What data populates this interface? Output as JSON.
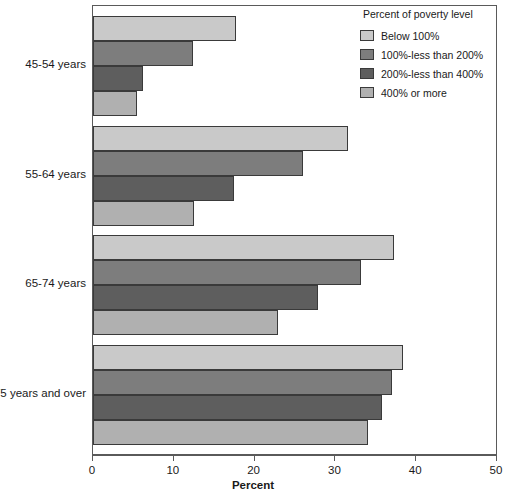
{
  "chart_data": {
    "type": "bar",
    "orientation": "horizontal",
    "title": "",
    "xlabel": "Percent",
    "ylabel": "",
    "xlim": [
      0,
      50
    ],
    "xticks": [
      0,
      10,
      20,
      30,
      40,
      50
    ],
    "grid": false,
    "legend_title": "Percent of poverty level",
    "legend_position": "top-right",
    "categories": [
      "45-54 years",
      "55-64 years",
      "65-74 years",
      "75 years and over"
    ],
    "series": [
      {
        "name": "Below 100%",
        "color": "#c9c9c9",
        "values": [
          17.7,
          31.5,
          37.2,
          38.4
        ]
      },
      {
        "name": "100%-less than 200%",
        "color": "#7d7d7d",
        "values": [
          12.4,
          26.0,
          33.2,
          37.0
        ]
      },
      {
        "name": "200%-less than 400%",
        "color": "#5e5e5e",
        "values": [
          6.2,
          17.4,
          27.9,
          35.8
        ]
      },
      {
        "name": "400% or more",
        "color": "#b0b0b0",
        "values": [
          5.4,
          12.5,
          22.9,
          34.0
        ]
      }
    ]
  },
  "axis": {
    "tick_labels": [
      "0",
      "10",
      "20",
      "30",
      "40",
      "50"
    ],
    "title": "Percent"
  },
  "legend": {
    "title": "Percent of poverty level",
    "entries": [
      {
        "label": "Below 100%"
      },
      {
        "label": "100%-less than 200%"
      },
      {
        "label": "200%-less than 400%"
      },
      {
        "label": "400% or more"
      }
    ]
  }
}
